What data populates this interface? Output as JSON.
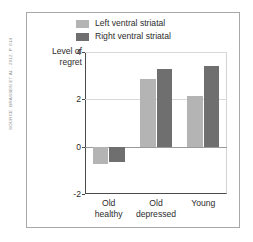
{
  "source_credit": "SOURCE: BRASSEN ET AL., 2012, P. 614",
  "legend": {
    "position": "top-center",
    "items": [
      {
        "label": "Left ventral striatal",
        "color": "#b4b4b4",
        "swatch_name": "legend-swatch-left-ventral-striatal"
      },
      {
        "label": "Right ventral striatal",
        "color": "#6f6f6f",
        "swatch_name": "legend-swatch-right-ventral-striatal"
      }
    ]
  },
  "axes": {
    "y_title_line1": "Level of",
    "y_title_line2": "regret",
    "y_ticks": [
      "4",
      "2",
      "0",
      "-2"
    ],
    "x_labels": [
      {
        "line1": "Old",
        "line2": "healthy"
      },
      {
        "line1": "Old",
        "line2": "depressed"
      },
      {
        "line1": "Young",
        "line2": ""
      }
    ]
  },
  "chart_data": {
    "type": "bar",
    "title": "",
    "subtitle": "",
    "xlabel": "",
    "ylabel": "Level of regret",
    "ylim": [
      -2,
      4
    ],
    "yticks": [
      -2,
      0,
      2,
      4
    ],
    "grid": true,
    "legend_position": "top-center",
    "categories": [
      "Old healthy",
      "Old depressed",
      "Young"
    ],
    "series": [
      {
        "name": "Left ventral striatal",
        "color": "#b4b4b4",
        "values": [
          -0.75,
          2.85,
          2.15
        ]
      },
      {
        "name": "Right ventral striatal",
        "color": "#6f6f6f",
        "values": [
          -0.65,
          3.3,
          3.4
        ]
      }
    ]
  }
}
